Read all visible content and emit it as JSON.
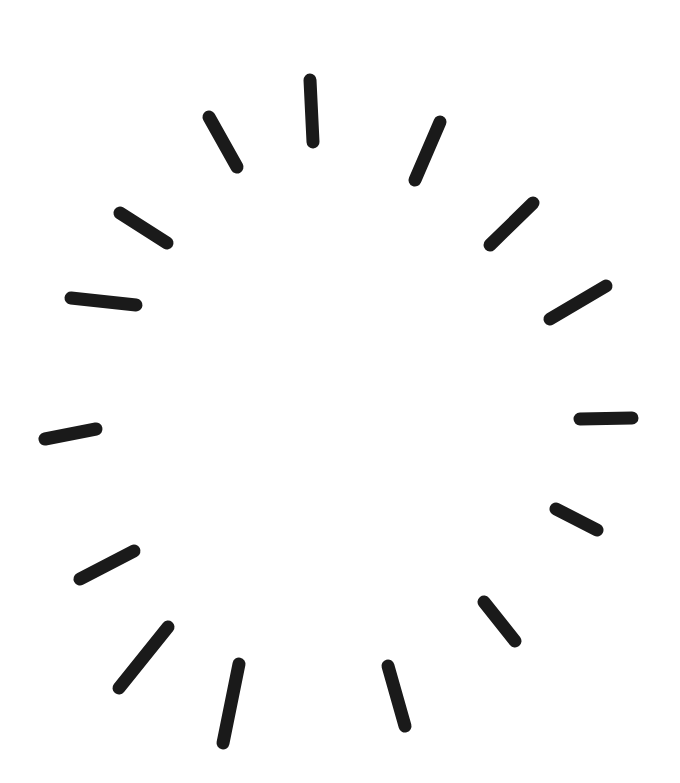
{
  "illustration": {
    "title": "Hand-drawn radial burst",
    "background": "#ffffff",
    "stroke_color": "#1a1a1a",
    "stroke_width": 13,
    "strokes": [
      {
        "x1": 310,
        "y1": 80,
        "x2": 313,
        "y2": 142
      },
      {
        "x1": 440,
        "y1": 122,
        "x2": 415,
        "y2": 180
      },
      {
        "x1": 533,
        "y1": 203,
        "x2": 490,
        "y2": 245
      },
      {
        "x1": 606,
        "y1": 286,
        "x2": 550,
        "y2": 319
      },
      {
        "x1": 580,
        "y1": 419,
        "x2": 632,
        "y2": 418
      },
      {
        "x1": 556,
        "y1": 509,
        "x2": 597,
        "y2": 530
      },
      {
        "x1": 484,
        "y1": 602,
        "x2": 515,
        "y2": 641
      },
      {
        "x1": 388,
        "y1": 666,
        "x2": 405,
        "y2": 726
      },
      {
        "x1": 239,
        "y1": 664,
        "x2": 223,
        "y2": 743
      },
      {
        "x1": 168,
        "y1": 627,
        "x2": 119,
        "y2": 688
      },
      {
        "x1": 134,
        "y1": 551,
        "x2": 80,
        "y2": 579
      },
      {
        "x1": 96,
        "y1": 429,
        "x2": 45,
        "y2": 439
      },
      {
        "x1": 71,
        "y1": 298,
        "x2": 136,
        "y2": 305
      },
      {
        "x1": 120,
        "y1": 213,
        "x2": 167,
        "y2": 243
      },
      {
        "x1": 209,
        "y1": 117,
        "x2": 237,
        "y2": 167
      }
    ]
  }
}
